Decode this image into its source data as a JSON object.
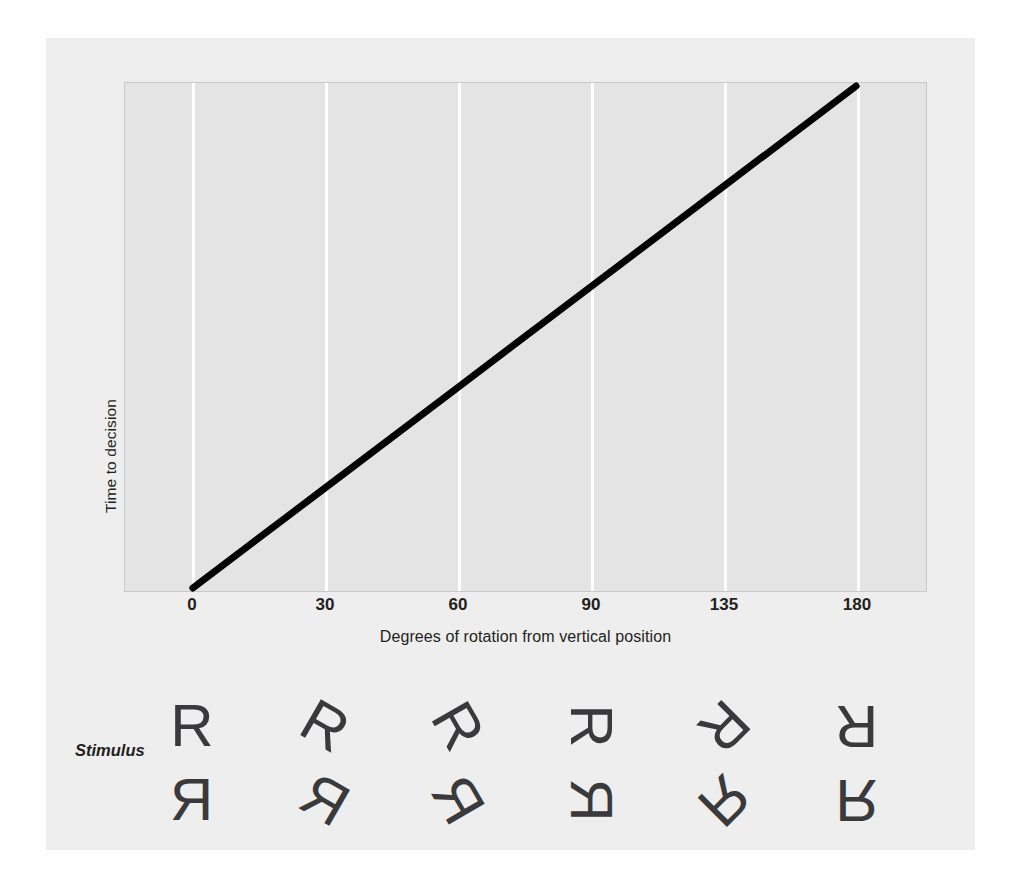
{
  "chart_data": {
    "type": "line",
    "title": "",
    "xlabel": "Degrees of rotation from vertical position",
    "ylabel": "Time to decision",
    "x": [
      0,
      30,
      60,
      90,
      135,
      180
    ],
    "xticklabels": [
      "0",
      "30",
      "60",
      "90",
      "135",
      "180"
    ],
    "values": [
      0,
      20,
      40,
      60,
      80,
      100
    ],
    "series": [
      {
        "name": "Time to decision",
        "values": [
          0,
          20,
          40,
          60,
          80,
          100
        ]
      }
    ],
    "xlim": [
      0,
      180
    ],
    "ylim": [
      0,
      100
    ],
    "yticklabels": [],
    "grid": "vertical-only",
    "grid_color": "#ffffff",
    "legend": "none",
    "line_color": "#000000",
    "plot_background": "#e4e4e4",
    "figure_background": "#eeeeee",
    "annotation": "Response time increases linearly with degrees of rotation from the vertical position."
  },
  "axes": {
    "y_label": "Time to decision",
    "x_label": "Degrees of rotation from vertical position",
    "x_ticks": [
      {
        "label": "0",
        "value": 0
      },
      {
        "label": "30",
        "value": 30
      },
      {
        "label": "60",
        "value": 60
      },
      {
        "label": "90",
        "value": 90
      },
      {
        "label": "135",
        "value": 135
      },
      {
        "label": "180",
        "value": 180
      }
    ]
  },
  "stimulus": {
    "label": "Stimulus",
    "glyph": "R",
    "columns": [
      {
        "degrees": "0",
        "normal_rotation": 0,
        "mirror_rotation": 0
      },
      {
        "degrees": "30",
        "normal_rotation": 30,
        "mirror_rotation": 30
      },
      {
        "degrees": "60",
        "normal_rotation": 60,
        "mirror_rotation": 60
      },
      {
        "degrees": "90",
        "normal_rotation": 90,
        "mirror_rotation": 90
      },
      {
        "degrees": "135",
        "normal_rotation": 135,
        "mirror_rotation": 135
      },
      {
        "degrees": "180",
        "normal_rotation": 180,
        "mirror_rotation": 180
      }
    ]
  },
  "colors": {
    "line": "#000000",
    "gridline": "#ffffff",
    "plot_bg": "#e4e4e4",
    "figure_bg": "#eeeeee",
    "text": "#231f20",
    "glyph": "#3a3a3c"
  }
}
